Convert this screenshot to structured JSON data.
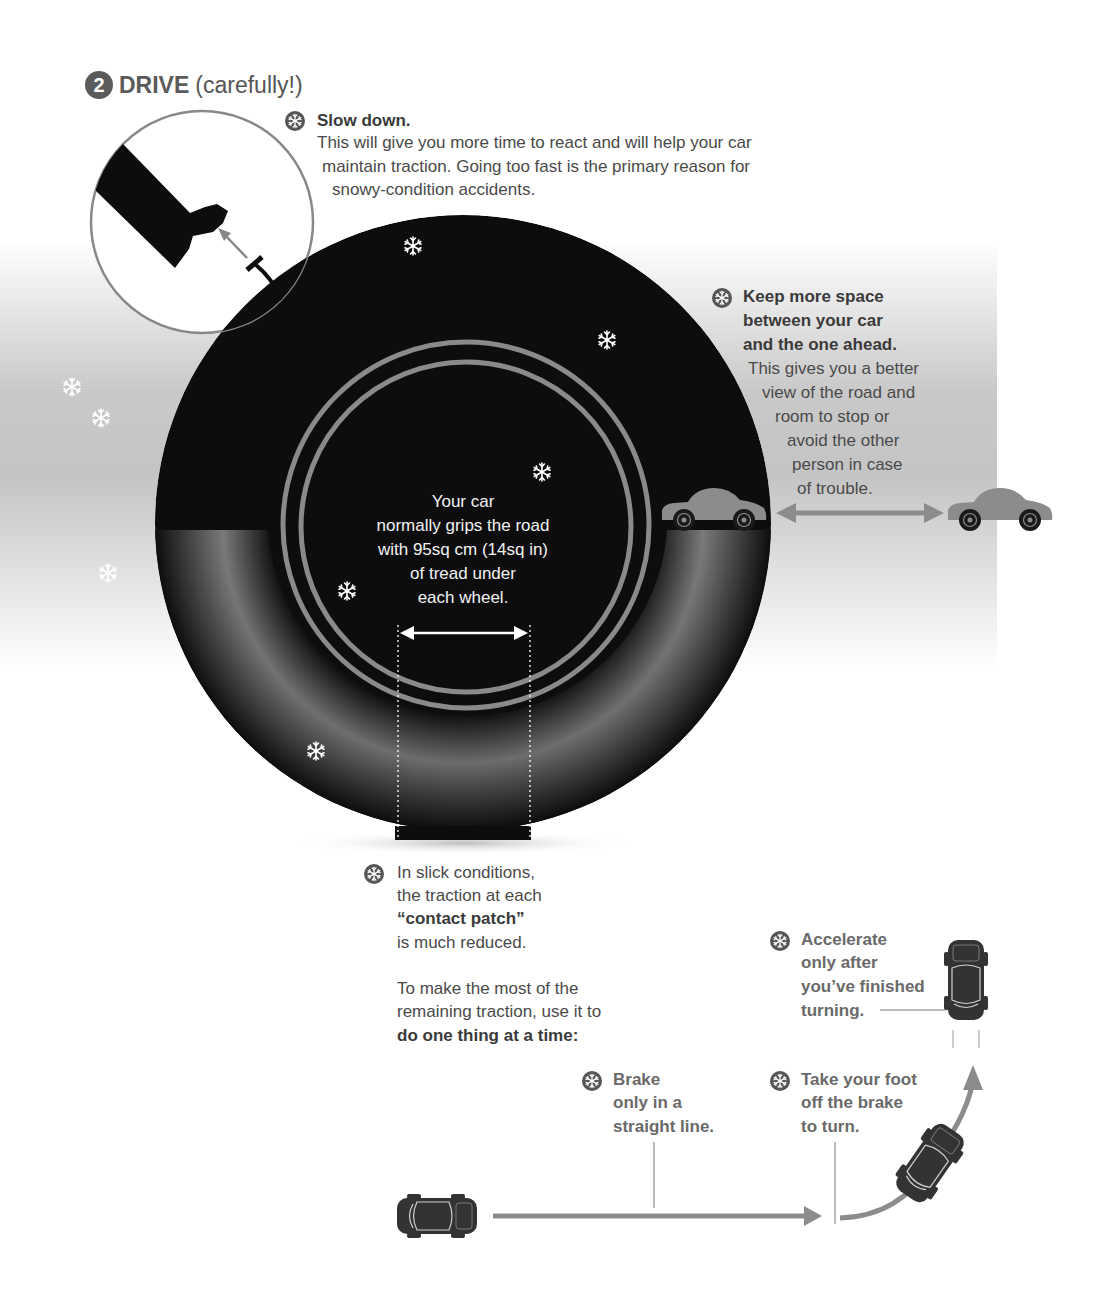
{
  "header": {
    "step_number": "2",
    "title": "DRIVE",
    "subtitle": "(carefully!)"
  },
  "slow_down": {
    "icon": "snowflake-icon",
    "heading": "Slow down.",
    "lines": [
      "This will give you more time to react and will help your car",
      "maintain traction. Going too fast is the primary reason for",
      "snowy-condition accidents."
    ]
  },
  "keep_space": {
    "icon": "snowflake-icon",
    "heading_lines": [
      "Keep more space",
      "between your car",
      "and the one ahead."
    ],
    "lines": [
      "This gives you a better",
      "view of the road and",
      "room to stop or",
      "avoid the other",
      "person in case",
      "of trouble."
    ]
  },
  "tire_caption": {
    "lines": [
      "Your car",
      "normally grips the road",
      "with 95sq cm (14sq in)",
      "of tread under",
      "each wheel."
    ]
  },
  "contact_patch": {
    "icon": "snowflake-icon",
    "lines": [
      "In slick conditions,",
      "the traction at each"
    ],
    "bold_term": "“contact patch”",
    "tail": "is much reduced.",
    "advice_lines": [
      "To make the most of the",
      "remaining traction, use it to"
    ],
    "advice_bold": "do one thing at a time:"
  },
  "tips": [
    {
      "id": "accelerate",
      "icon": "snowflake-icon",
      "lines": [
        "Accelerate",
        "only after",
        "you’ve finished",
        "turning."
      ]
    },
    {
      "id": "brake",
      "icon": "snowflake-icon",
      "lines": [
        "Brake",
        "only in a",
        "straight line."
      ]
    },
    {
      "id": "foot-off",
      "icon": "snowflake-icon",
      "lines": [
        "Take your foot",
        "off the brake",
        "to turn."
      ]
    }
  ],
  "colors": {
    "tire": "#0d0d0d",
    "rim": "#8a8a8a",
    "car_side": "#8c8c8c",
    "arrow": "#8c8c8c",
    "badge": "#5b5b5b",
    "text": "#4a4a4a",
    "tip_text": "#6a6a6a"
  }
}
